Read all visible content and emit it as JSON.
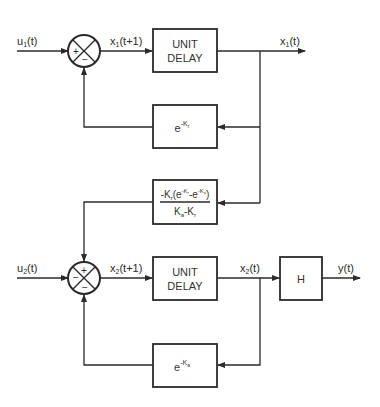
{
  "diagram": {
    "type": "block-diagram",
    "colors": {
      "stroke": "#2a2a2a",
      "background": "#ffffff"
    },
    "inputs": {
      "u1": {
        "base": "u",
        "sub": "1",
        "arg": "(t)"
      },
      "u2": {
        "base": "u",
        "sub": "2",
        "arg": "(t)"
      }
    },
    "signals": {
      "x1_next": {
        "base": "x",
        "sub": "1",
        "arg": "(t+1)"
      },
      "x1": {
        "base": "x",
        "sub": "1",
        "arg": "(t)"
      },
      "x2_next": {
        "base": "x",
        "sub": "2",
        "arg": "(t+1)"
      },
      "x2": {
        "base": "x",
        "sub": "2",
        "arg": "(t)"
      },
      "y": {
        "text": "y(t)"
      }
    },
    "summing_junctions": {
      "upper": {
        "left_sign": "+",
        "bottom_sign": "−"
      },
      "lower": {
        "top_sign": "+",
        "left_sign": "−",
        "bottom_sign": "−"
      }
    },
    "blocks": {
      "delay1": {
        "line1": "UNIT",
        "line2": "DELAY"
      },
      "feedback1": {
        "base": "e",
        "exp": "-K",
        "exp_sub": "r"
      },
      "coupling": {
        "numerator": "-K",
        "numerator_sub": "r",
        "numerator_paren_open": "(e",
        "exp1": "-K",
        "exp1_sub": "r",
        "mid": "-e",
        "exp2": "-K",
        "exp2_sub": "a",
        "paren_close": ")",
        "denominator_a": "K",
        "denominator_a_sub": "a",
        "denominator_minus": "-K",
        "denominator_b_sub": "r"
      },
      "delay2": {
        "line1": "UNIT",
        "line2": "DELAY"
      },
      "output": {
        "label": "H"
      },
      "feedback2": {
        "base": "e",
        "exp": "-K",
        "exp_sub": "a"
      }
    }
  }
}
